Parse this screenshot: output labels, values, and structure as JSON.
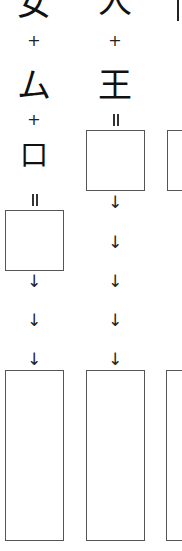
{
  "worksheet": {
    "columns": [
      {
        "id": "left",
        "components": [
          "女",
          "ム",
          "口"
        ],
        "operators": [
          "+",
          "+",
          "="
        ],
        "arrows": [
          "↓",
          "↓",
          "↓"
        ]
      },
      {
        "id": "middle",
        "components": [
          "人",
          "王"
        ],
        "operators": [
          "+",
          "="
        ],
        "arrows": [
          "↓",
          "↓",
          "↓",
          "↓",
          "↓"
        ]
      },
      {
        "id": "right",
        "components": [
          "|"
        ],
        "operators": [],
        "arrows": []
      }
    ],
    "colors": {
      "ink": "#111111",
      "box_border": "#555555",
      "background": "#ffffff"
    }
  }
}
